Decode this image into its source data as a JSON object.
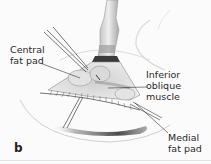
{
  "figure": {
    "panel_letter": "b",
    "labels": {
      "central_fat_pad": "Central\nfat pad",
      "inferior_oblique_muscle": "Inferior oblique\nmuscle",
      "medial_fat_pad": "Medial\nfat pad"
    },
    "colors": {
      "background": "#fbfbfb",
      "line": "#3a3a3a",
      "shadow": "#4a4a4a",
      "tissue": "#d9d9d9"
    }
  }
}
